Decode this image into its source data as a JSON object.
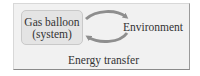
{
  "diagram": {
    "system": {
      "line1": "Gas balloon",
      "line2": "(system)"
    },
    "environment": "Environment",
    "caption": "Energy transfer",
    "colors": {
      "frame_fill": "#f1f1f1",
      "system_fill": "#e4e4e4",
      "arrow": "#8e8e8e",
      "text": "#333333"
    },
    "arrows": [
      {
        "from": "system",
        "to": "environment",
        "direction": "clockwise-top"
      },
      {
        "from": "environment",
        "to": "system",
        "direction": "clockwise-bottom"
      }
    ]
  }
}
